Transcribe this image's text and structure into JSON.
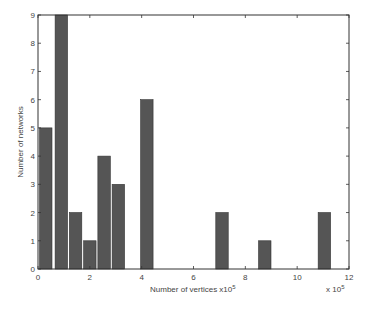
{
  "chart_data": {
    "type": "bar",
    "title": "",
    "xlabel": "Number of vertices x10^5",
    "xlabel_text": "Number of vertices x10",
    "xlabel_exp": "5",
    "ylabel": "Number of networks",
    "x_multiplier_text": "x 10",
    "x_multiplier_exp": "5",
    "xlim": [
      0,
      12
    ],
    "ylim": [
      0,
      9
    ],
    "xticks": [
      0,
      2,
      4,
      6,
      8,
      10,
      12
    ],
    "yticks": [
      0,
      1,
      2,
      3,
      4,
      5,
      6,
      7,
      8,
      9
    ],
    "grid": false,
    "legend": null,
    "bar_width": 0.48,
    "x": [
      0.3,
      0.9,
      1.45,
      2.0,
      2.55,
      3.1,
      4.2,
      7.1,
      8.75,
      11.05
    ],
    "values": [
      5,
      9,
      2,
      1,
      4,
      3,
      6,
      2,
      1,
      2
    ],
    "bar_color": "#555555"
  }
}
